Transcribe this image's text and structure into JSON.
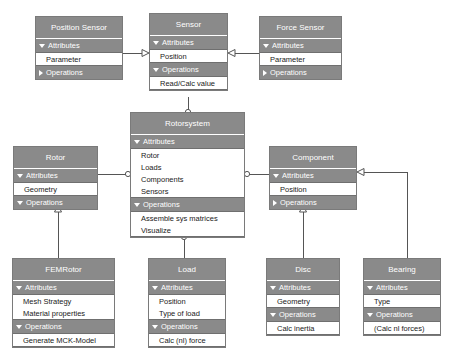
{
  "diagram": {
    "colors": {
      "class_fill": "#8a8a8a",
      "class_border": "#7a7a7a",
      "member_fill": "#ffffff",
      "title_text": "#ffffff",
      "member_text": "#1a1a1a",
      "line": "#555555",
      "background": "#ffffff"
    },
    "section_labels": {
      "attributes": "Attributes",
      "operations": "Operations"
    },
    "classes": [
      {
        "id": "position-sensor",
        "name": "Position Sensor",
        "x": 35,
        "y": 16,
        "w": 88,
        "attributes_expanded": true,
        "attributes": [
          "Parameter"
        ],
        "operations_expanded": false,
        "operations": []
      },
      {
        "id": "sensor",
        "name": "Sensor",
        "x": 149,
        "y": 13,
        "w": 79,
        "attributes_expanded": true,
        "attributes": [
          "Position"
        ],
        "operations_expanded": true,
        "operations": [
          "Read/Calc value"
        ]
      },
      {
        "id": "force-sensor",
        "name": "Force Sensor",
        "x": 259,
        "y": 16,
        "w": 83,
        "attributes_expanded": true,
        "attributes": [
          "Parameter"
        ],
        "operations_expanded": false,
        "operations": []
      },
      {
        "id": "rotorsystem",
        "name": "Rotorsystem",
        "x": 130,
        "y": 112,
        "w": 115,
        "attributes_expanded": true,
        "attributes": [
          "Rotor",
          "Loads",
          "Components",
          "Sensors"
        ],
        "operations_expanded": true,
        "operations": [
          "Assemble sys matrices",
          "Visualize"
        ]
      },
      {
        "id": "rotor",
        "name": "Rotor",
        "x": 13,
        "y": 146,
        "w": 85,
        "attributes_expanded": true,
        "attributes": [
          "Geometry"
        ],
        "operations_expanded": true,
        "operations": []
      },
      {
        "id": "component",
        "name": "Component",
        "x": 269,
        "y": 146,
        "w": 88,
        "attributes_expanded": true,
        "attributes": [
          "Position"
        ],
        "operations_expanded": false,
        "operations": []
      },
      {
        "id": "femrotor",
        "name": "FEMRotor",
        "x": 12,
        "y": 258,
        "w": 103,
        "attributes_expanded": true,
        "attributes": [
          "Mesh Strategy",
          "Material properties"
        ],
        "operations_expanded": true,
        "operations": [
          "Generate MCK-Model"
        ]
      },
      {
        "id": "load",
        "name": "Load",
        "x": 148,
        "y": 258,
        "w": 78,
        "attributes_expanded": true,
        "attributes": [
          "Position",
          "Type of load"
        ],
        "operations_expanded": true,
        "operations": [
          "Calc (nl) force"
        ]
      },
      {
        "id": "disc",
        "name": "Disc",
        "x": 266,
        "y": 258,
        "w": 74,
        "attributes_expanded": true,
        "attributes": [
          "Geometry"
        ],
        "operations_expanded": true,
        "operations": [
          "Calc inertia"
        ]
      },
      {
        "id": "bearing",
        "name": "Bearing",
        "x": 363,
        "y": 258,
        "w": 78,
        "attributes_expanded": true,
        "attributes": [
          "Type"
        ],
        "operations_expanded": true,
        "operations": [
          "(Calc nl forces)"
        ]
      }
    ],
    "connectors": [
      {
        "id": "position-sensor-to-sensor",
        "kind": "generalization"
      },
      {
        "id": "force-sensor-to-sensor",
        "kind": "generalization"
      },
      {
        "id": "sensor-to-rotorsystem",
        "kind": "aggregation"
      },
      {
        "id": "rotor-to-rotorsystem",
        "kind": "aggregation"
      },
      {
        "id": "component-to-rotorsystem",
        "kind": "aggregation"
      },
      {
        "id": "load-to-rotorsystem",
        "kind": "aggregation"
      },
      {
        "id": "femrotor-to-rotor",
        "kind": "generalization"
      },
      {
        "id": "disc-to-component",
        "kind": "generalization"
      },
      {
        "id": "bearing-to-component",
        "kind": "generalization"
      }
    ]
  }
}
